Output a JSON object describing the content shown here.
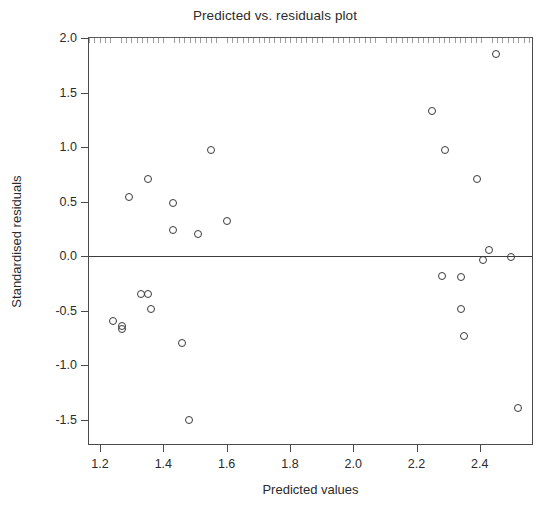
{
  "chart_data": {
    "type": "scatter",
    "title": "Predicted vs. residuals plot",
    "xlabel": "Predicted values",
    "ylabel": "Standardised residuals",
    "xlim": [
      1.165,
      2.565
    ],
    "ylim": [
      -1.72,
      2.0
    ],
    "grid": false,
    "legend": null,
    "xticks": [
      "1.2",
      "1.4",
      "1.6",
      "1.8",
      "2.0",
      "2.2",
      "2.4"
    ],
    "xtick_values": [
      1.2,
      1.4,
      1.6,
      1.8,
      2.0,
      2.2,
      2.4
    ],
    "yticks": [
      "2.0",
      "1.5",
      "1.0",
      "0.5",
      "0.0",
      "-0.5",
      "-1.0",
      "-1.5"
    ],
    "ytick_values": [
      2.0,
      1.5,
      1.0,
      0.5,
      0.0,
      -0.5,
      -1.0,
      -1.5
    ],
    "reference_lines": [
      {
        "axis": "y",
        "value": 0.0
      }
    ],
    "marker": "open-circle",
    "marker_color": "#3a3a3a",
    "points": [
      {
        "x": 1.24,
        "y": -0.59
      },
      {
        "x": 1.27,
        "y": -0.64
      },
      {
        "x": 1.27,
        "y": -0.67
      },
      {
        "x": 1.29,
        "y": 0.54
      },
      {
        "x": 1.33,
        "y": -0.35
      },
      {
        "x": 1.35,
        "y": -0.35
      },
      {
        "x": 1.35,
        "y": 0.71
      },
      {
        "x": 1.36,
        "y": -0.48
      },
      {
        "x": 1.43,
        "y": 0.49
      },
      {
        "x": 1.43,
        "y": 0.24
      },
      {
        "x": 1.46,
        "y": -0.79
      },
      {
        "x": 1.48,
        "y": -1.5
      },
      {
        "x": 1.51,
        "y": 0.2
      },
      {
        "x": 1.55,
        "y": 0.97
      },
      {
        "x": 1.6,
        "y": 0.32
      },
      {
        "x": 2.25,
        "y": 1.33
      },
      {
        "x": 2.28,
        "y": -0.18
      },
      {
        "x": 2.29,
        "y": 0.97
      },
      {
        "x": 2.34,
        "y": -0.48
      },
      {
        "x": 2.34,
        "y": -0.19
      },
      {
        "x": 2.35,
        "y": -0.73
      },
      {
        "x": 2.39,
        "y": 0.71
      },
      {
        "x": 2.41,
        "y": -0.03
      },
      {
        "x": 2.43,
        "y": 0.06
      },
      {
        "x": 2.45,
        "y": 1.85
      },
      {
        "x": 2.5,
        "y": -0.01
      },
      {
        "x": 2.52,
        "y": -1.39
      }
    ]
  }
}
